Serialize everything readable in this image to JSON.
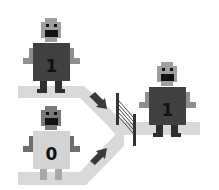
{
  "diagram": {
    "colors": {
      "background": "#ffffff",
      "path": "#d9d9d9",
      "arrow": "#3a3a3a",
      "gate": "#333333",
      "head_light": "#9e9e9e",
      "head_dark": "#7a7a7a",
      "body_dark": "#404040",
      "body_light": "#d4d4d4",
      "limb": "#8e8e8e",
      "leg_dark": "#2e2e2e",
      "leg_light": "#a8a8a8",
      "face": "#111111"
    },
    "robots": [
      {
        "id": "top-input",
        "label": "1",
        "body": "dark"
      },
      {
        "id": "bottom-input",
        "label": "0",
        "body": "light"
      },
      {
        "id": "output",
        "label": "1",
        "body": "dark"
      }
    ],
    "arrows": [
      {
        "id": "upper-arrow",
        "direction": "down-right"
      },
      {
        "id": "lower-arrow",
        "direction": "up-right"
      }
    ],
    "gate": {
      "id": "gate",
      "style": "hatched"
    }
  }
}
